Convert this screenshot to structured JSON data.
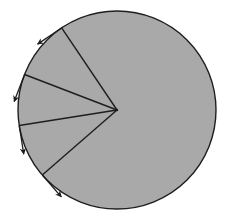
{
  "diagram": {
    "colors": {
      "fill": "#a9a9a9",
      "stroke": "#1e1e1e",
      "background": "#ffffff"
    },
    "rotation_direction": "counterclockwise",
    "radial_lines": [
      {
        "id": "radius-1",
        "angle_deg": 124
      },
      {
        "id": "radius-2",
        "angle_deg": 159
      },
      {
        "id": "radius-3",
        "angle_deg": 189
      },
      {
        "id": "radius-4",
        "angle_deg": 221
      }
    ],
    "tangent_vectors": [
      {
        "id": "velocity-1",
        "at_radius": "radius-1",
        "direction": "tangential-ccw"
      },
      {
        "id": "velocity-2",
        "at_radius": "radius-2",
        "direction": "tangential-ccw"
      },
      {
        "id": "velocity-3",
        "at_radius": "radius-3",
        "direction": "tangential-ccw"
      },
      {
        "id": "velocity-4",
        "at_radius": "radius-4",
        "direction": "tangential-ccw"
      }
    ]
  }
}
